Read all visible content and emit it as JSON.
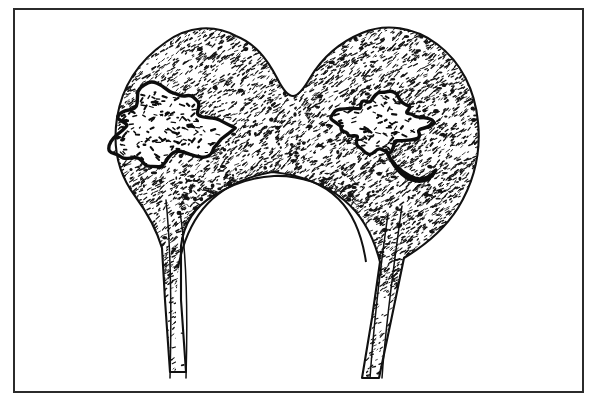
{
  "figure": {
    "domain": "Natural-Image",
    "kind": "line-art-medical-illustration",
    "title": "Stippled line drawing of a bone end with two lytic lesions",
    "background_color": "#ffffff",
    "ink_color": "#1a1a1a",
    "canvas": {
      "width": 593,
      "height": 404
    }
  },
  "frame": {
    "name": "outer rectangular border",
    "stroke_color": "#2b2b2b",
    "stroke_width": 2,
    "x": 14,
    "y": 9,
    "width": 569,
    "height": 383
  },
  "drawing": {
    "outline": {
      "name": "bone cortical outline",
      "stroke_color": "#111111",
      "stroke_width": 2.1,
      "description": "Heart-shaped bicondylar bone end with central superior notch, widening epiphysis and tapering diaphyseal shaft below",
      "path": "M 236 36 C 214 24 188 26 166 42 C 140 60 122 86 117 118 C 112 150 120 176 135 196 C 146 211 156 228 162 248 L 165 300 L 170 372 L 186 372 L 181 300 L 181 246 C 184 222 196 206 213 196 C 232 184 252 177 274 176 C 300 175 325 184 344 200 C 362 215 374 238 380 262 L 372 318 L 362 378 L 379 378 L 392 316 L 404 258 C 424 246 444 230 458 208 C 474 182 481 152 478 122 C 475 90 461 62 437 44 C 414 27 386 23 362 33 C 340 42 322 58 310 78 C 303 90 298 96 293 96 C 288 96 283 90 277 78 C 266 57 254 43 236 36 Z"
    },
    "stipple_field": {
      "name": "cancellous bone stipple texture",
      "description": "Dense random short-dash stipple filling the epiphysis and condyles, sparser mottled stipple in the metaphysis, and a dense patch low in the shaft",
      "density_dense": 0.62,
      "density_sparse": 0.18,
      "dot_color": "#141414"
    },
    "lesions": [
      {
        "id": "lesion-left",
        "name": "left lytic lesion",
        "description": "Lobulated radiolucent lesion with thick sclerotic margin in the left (medial) condyle",
        "center_x": 166,
        "center_y": 128,
        "width": 104,
        "height": 72,
        "border_color": "#0d0d0d",
        "border_width": 3.4,
        "fill": "#ffffff"
      },
      {
        "id": "lesion-right",
        "name": "right lytic lesion",
        "description": "Irregular branching radiolucent lesion with sclerotic margin extending inferolaterally in the right condyle",
        "center_x": 381,
        "center_y": 129,
        "width": 98,
        "height": 86,
        "border_color": "#0d0d0d",
        "border_width": 3.4,
        "fill": "#ffffff"
      }
    ],
    "cortical_shaft_lines": {
      "name": "diaphyseal cortical margins",
      "description": "Paired thin parallel lines forming the left and right cortices of the bone shaft running to the lower edge",
      "stroke_color": "#111111",
      "stroke_width": 1.5,
      "left_inner_x": 188,
      "left_outer_x": 171,
      "right_inner_x": 355,
      "right_outer_x": 375,
      "bottom_y": 378
    },
    "metaphysis": {
      "name": "metaphyseal lucent region",
      "description": "Broad pale dome-shaped lucent metaphysis with speckled trabecular markings, bounded above by the arched cortical line",
      "apex_x": 272,
      "apex_y": 172,
      "fill": "#ffffff"
    }
  }
}
